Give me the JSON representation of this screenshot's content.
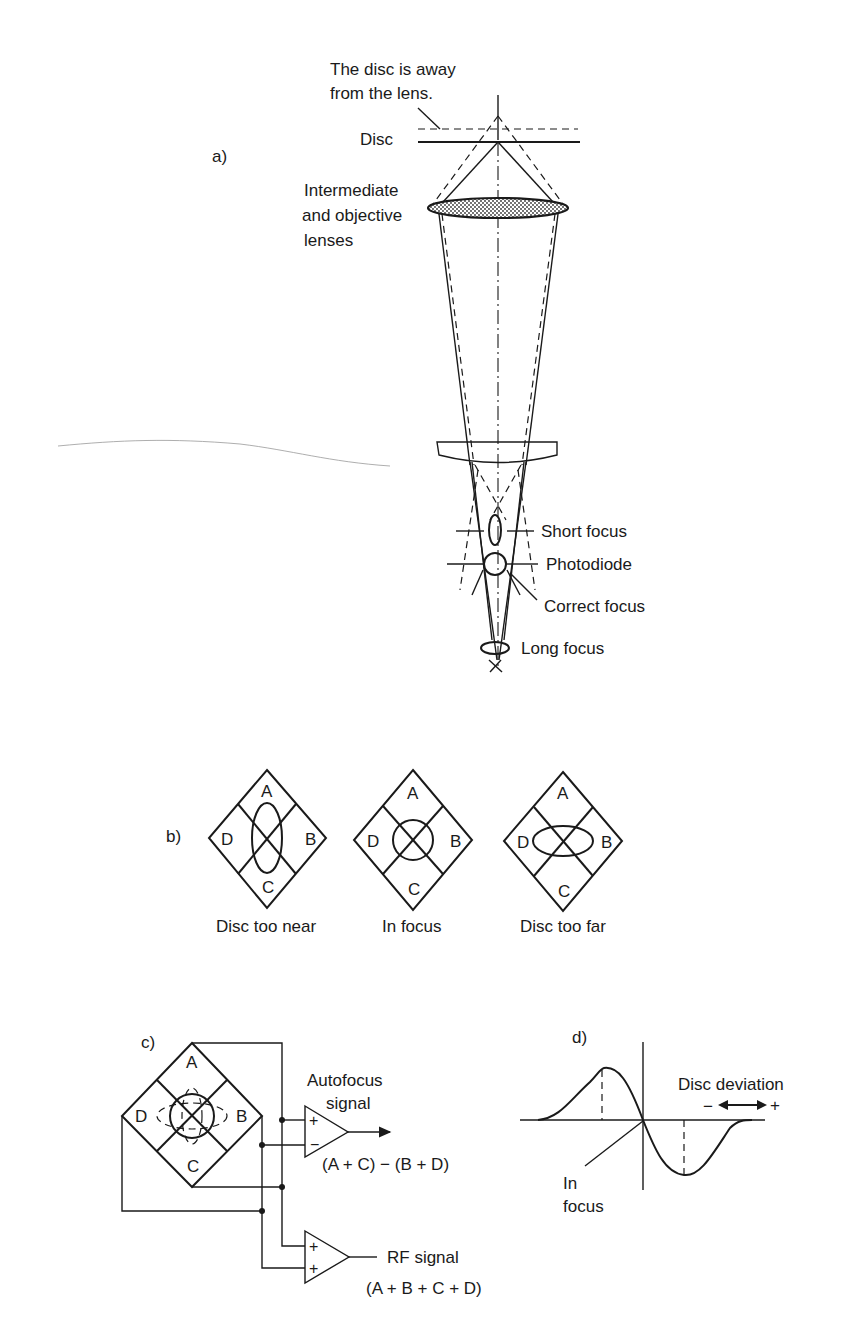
{
  "figure": {
    "panel_a": {
      "label": "a)",
      "annotation_line1": "The disc is away",
      "annotation_line2": "from the lens.",
      "disc_label": "Disc",
      "lens_label_line1": "Intermediate",
      "lens_label_line2": "and objective",
      "lens_label_line3": "lenses",
      "short_focus": "Short focus",
      "photodiode": "Photodiode",
      "correct_focus": "Correct focus",
      "long_focus": "Long focus"
    },
    "panel_b": {
      "label": "b)",
      "quadrants": [
        "A",
        "B",
        "C",
        "D"
      ],
      "diagrams": [
        {
          "caption": "Disc too near",
          "spot": "vertical-ellipse"
        },
        {
          "caption": "In focus",
          "spot": "circle"
        },
        {
          "caption": "Disc too far",
          "spot": "horizontal-ellipse"
        }
      ]
    },
    "panel_c": {
      "label": "c)",
      "quadrants": [
        "A",
        "B",
        "C",
        "D"
      ],
      "autofocus_line1": "Autofocus",
      "autofocus_line2": "signal",
      "autofocus_formula": "(A + C) − (B + D)",
      "amp1_plus": "+",
      "amp1_minus": "−",
      "amp2_plus1": "+",
      "amp2_plus2": "+",
      "rf_label": "RF signal",
      "rf_formula": "(A + B + C + D)"
    },
    "panel_d": {
      "label": "d)",
      "axis_label": "Disc deviation",
      "minus": "−",
      "plus": "+",
      "in_focus_line1": "In",
      "in_focus_line2": "focus"
    }
  }
}
